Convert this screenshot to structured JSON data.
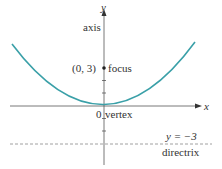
{
  "diagram": {
    "type": "parabola",
    "equation": "x^2 = 12y",
    "labels": {
      "y_axis": "y",
      "x_axis": "x",
      "axis": "axis",
      "focus_coord": "(0, 3)",
      "focus": "focus",
      "origin": "0",
      "vertex": "vertex",
      "directrix_eq": "y = −3",
      "directrix": "directrix"
    },
    "points": {
      "vertex": [
        0,
        0
      ],
      "focus": [
        0,
        3
      ]
    },
    "directrix_y": -3,
    "colors": {
      "curve": "#3aa0a8",
      "axes": "#555555",
      "directrix": "#888888",
      "text": "#333333"
    }
  }
}
